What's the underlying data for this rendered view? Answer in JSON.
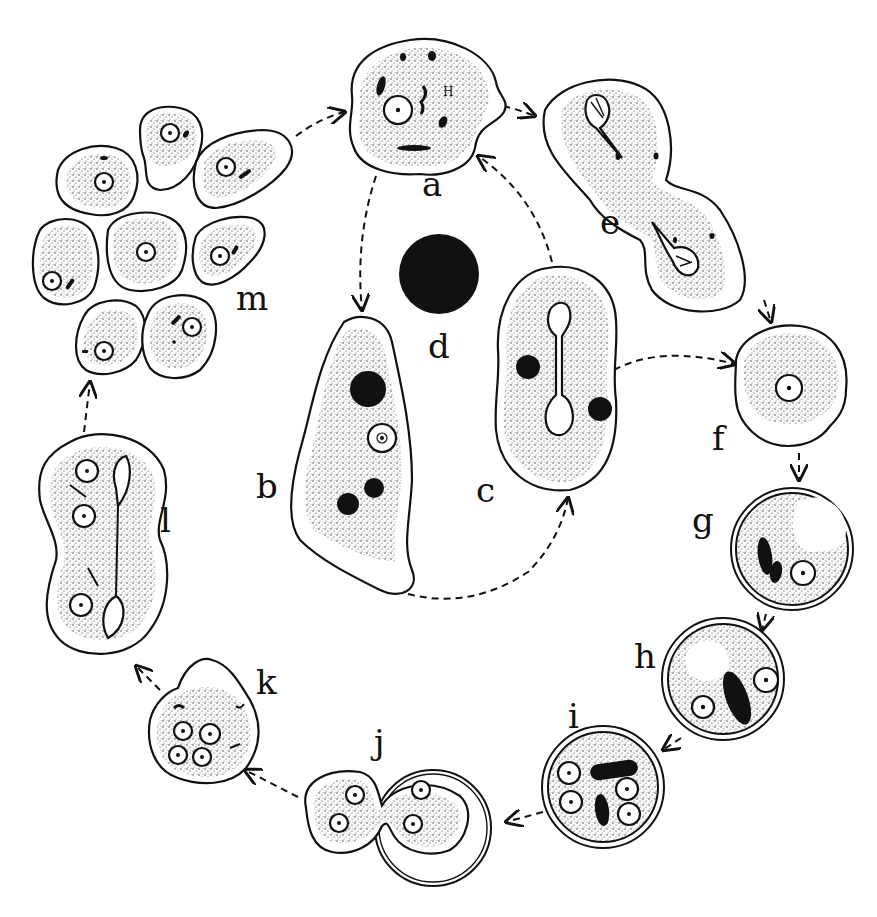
{
  "figure": {
    "labels": {
      "a": "a",
      "b": "b",
      "c": "c",
      "d": "d",
      "e": "e",
      "f": "f",
      "g": "g",
      "h": "h",
      "i": "i",
      "j": "j",
      "k": "k",
      "l": "l",
      "m": "m"
    },
    "stages": [
      {
        "id": "a",
        "description": "rounded trophozoite with nucleus and chromatoid bodies",
        "label_pos": [
          433,
          196
        ]
      },
      {
        "id": "b",
        "description": "elongated amoeba with nucleus and three dark inclusions",
        "label_pos": [
          268,
          496
        ]
      },
      {
        "id": "c",
        "description": "amoeba with dividing (dumbbell) nucleus and two dark inclusions",
        "label_pos": [
          487,
          500
        ]
      },
      {
        "id": "d",
        "description": "solid dark spherical body",
        "label_pos": [
          428,
          356
        ]
      },
      {
        "id": "e",
        "description": "binary fission of trophozoite",
        "label_pos": [
          600,
          232
        ]
      },
      {
        "id": "f",
        "description": "rounded precystic form",
        "label_pos": [
          720,
          448
        ]
      },
      {
        "id": "g",
        "description": "uninucleate cyst with vacuole and chromatoid bars",
        "label_pos": [
          692,
          530
        ]
      },
      {
        "id": "h",
        "description": "binucleate cyst",
        "label_pos": [
          636,
          666
        ]
      },
      {
        "id": "i",
        "description": "quadrinucleate cyst",
        "label_pos": [
          571,
          725
        ]
      },
      {
        "id": "j",
        "description": "excystation from cyst wall",
        "label_pos": [
          374,
          752
        ]
      },
      {
        "id": "k",
        "description": "metacystic amoeba with four nuclei",
        "label_pos": [
          258,
          692
        ]
      },
      {
        "id": "l",
        "description": "dividing metacystic amoeba",
        "label_pos": [
          162,
          530
        ]
      },
      {
        "id": "m",
        "description": "group of eight young amoebae",
        "label_pos": [
          250,
          309
        ]
      }
    ],
    "arrows": [
      {
        "from": "m",
        "to": "a"
      },
      {
        "from": "a",
        "to": "e"
      },
      {
        "from": "a",
        "to": "b"
      },
      {
        "from": "c",
        "to": "a"
      },
      {
        "from": "b",
        "to": "c"
      },
      {
        "from": "c",
        "to": "f"
      },
      {
        "from": "e",
        "to": "f"
      },
      {
        "from": "f",
        "to": "g"
      },
      {
        "from": "g",
        "to": "h"
      },
      {
        "from": "h",
        "to": "i"
      },
      {
        "from": "i",
        "to": "j"
      },
      {
        "from": "j",
        "to": "k"
      },
      {
        "from": "k",
        "to": "l"
      },
      {
        "from": "l",
        "to": "m"
      }
    ]
  }
}
